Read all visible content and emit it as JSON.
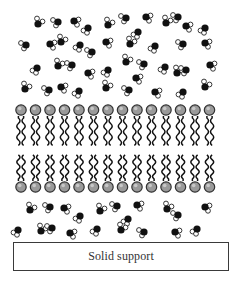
{
  "figure": {
    "type": "supported lipid bilayer schematic",
    "support": {
      "label": "Solid support"
    },
    "colors": {
      "oxygen": "#111111",
      "hydrogen_fill": "#ffffff",
      "hydrogen_stroke": "#222222",
      "head_fill": "#9a9a9a",
      "head_stroke": "#333333",
      "tail": "#111111",
      "support_border": "#3a3a3a"
    },
    "bilayer": {
      "lipids_per_leaflet": 14,
      "x_start": 21,
      "x_step": 14.5,
      "head_radius": 5.2,
      "top_leaflet": {
        "head_y": 110,
        "tail_start_y": 116,
        "tail_end_y": 149
      },
      "bottom_leaflet": {
        "head_y": 187,
        "tail_start_y": 181,
        "tail_end_y": 152
      }
    },
    "water_region_top": {
      "molecules": [
        [
          38,
          24,
          0
        ],
        [
          58,
          22,
          1
        ],
        [
          74,
          21,
          2
        ],
        [
          88,
          28,
          3
        ],
        [
          108,
          25,
          0
        ],
        [
          126,
          18,
          1
        ],
        [
          146,
          17,
          2
        ],
        [
          138,
          32,
          3
        ],
        [
          166,
          23,
          0
        ],
        [
          178,
          17,
          1
        ],
        [
          186,
          26,
          2
        ],
        [
          205,
          28,
          3
        ],
        [
          26,
          45,
          1
        ],
        [
          50,
          44,
          2
        ],
        [
          61,
          42,
          0
        ],
        [
          80,
          45,
          3
        ],
        [
          92,
          52,
          1
        ],
        [
          106,
          42,
          2
        ],
        [
          130,
          44,
          0
        ],
        [
          155,
          46,
          3
        ],
        [
          183,
          44,
          1
        ],
        [
          205,
          43,
          2
        ],
        [
          37,
          68,
          3
        ],
        [
          58,
          66,
          0
        ],
        [
          72,
          65,
          1
        ],
        [
          88,
          73,
          2
        ],
        [
          108,
          70,
          3
        ],
        [
          126,
          62,
          0
        ],
        [
          144,
          64,
          1
        ],
        [
          136,
          78,
          2
        ],
        [
          165,
          67,
          3
        ],
        [
          177,
          73,
          0
        ],
        [
          186,
          70,
          1
        ],
        [
          210,
          65,
          2
        ],
        [
          25,
          89,
          0
        ],
        [
          49,
          90,
          1
        ],
        [
          61,
          87,
          2
        ],
        [
          79,
          91,
          3
        ],
        [
          106,
          88,
          0
        ],
        [
          129,
          90,
          1
        ],
        [
          155,
          92,
          2
        ],
        [
          183,
          92,
          3
        ],
        [
          205,
          87,
          0
        ]
      ]
    },
    "water_region_bottom": {
      "molecules": [
        [
          30,
          210,
          0
        ],
        [
          50,
          207,
          1
        ],
        [
          64,
          208,
          2
        ],
        [
          80,
          216,
          3
        ],
        [
          100,
          211,
          0
        ],
        [
          117,
          206,
          1
        ],
        [
          137,
          205,
          2
        ],
        [
          128,
          219,
          3
        ],
        [
          167,
          209,
          0
        ],
        [
          178,
          215,
          1
        ],
        [
          205,
          207,
          2
        ],
        [
          18,
          230,
          3
        ],
        [
          41,
          231,
          0
        ],
        [
          52,
          228,
          1
        ],
        [
          70,
          233,
          2
        ],
        [
          97,
          229,
          3
        ],
        [
          121,
          230,
          0
        ],
        [
          144,
          232,
          1
        ],
        [
          175,
          232,
          2
        ],
        [
          197,
          229,
          3
        ]
      ]
    }
  }
}
